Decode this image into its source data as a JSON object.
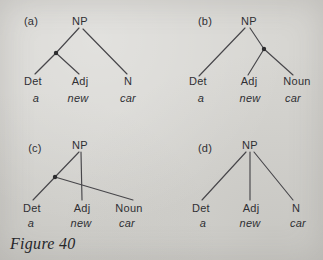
{
  "figure": {
    "caption": "Figure 40"
  },
  "colors": {
    "paper": "#d7d6d2",
    "ink": "#2f2f33",
    "line": "#47464a"
  },
  "trees": [
    {
      "panel": "(a)",
      "root": "NP",
      "categories": [
        "Det",
        "Adj",
        "N"
      ],
      "words": [
        "a",
        "new",
        "car"
      ],
      "structure": "dot node on left branch grouping Det and Adj"
    },
    {
      "panel": "(b)",
      "root": "NP",
      "categories": [
        "Det",
        "Adj",
        "Noun"
      ],
      "words": [
        "a",
        "new",
        "car"
      ],
      "structure": "dot node on right branch grouping Adj and Noun"
    },
    {
      "panel": "(c)",
      "root": "NP",
      "categories": [
        "Det",
        "Adj",
        "Noun"
      ],
      "words": [
        "a",
        "new",
        "car"
      ],
      "structure": "dot node grouping Det and Noun; branch to Noun crosses NP-Adj branch"
    },
    {
      "panel": "(d)",
      "root": "NP",
      "categories": [
        "Det",
        "Adj",
        "N"
      ],
      "words": [
        "a",
        "new",
        "car"
      ],
      "structure": "flat ternary branching NP over Det Adj N"
    }
  ]
}
